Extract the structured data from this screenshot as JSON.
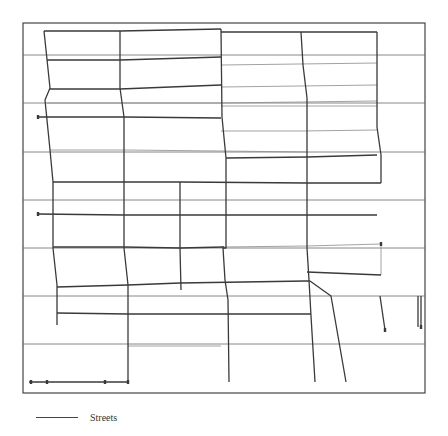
{
  "legend": {
    "items": [
      {
        "label": "Streets",
        "color": "#444444"
      }
    ]
  },
  "colors": {
    "street": "#3a3a3a",
    "grid": "#6a6a6a",
    "faint_street": "#8a8a8a",
    "frame": "#444444",
    "background": "#ffffff"
  },
  "map": {
    "frame": {
      "x": 23,
      "y": 23,
      "width": 402,
      "height": 370
    },
    "grid_y": [
      55,
      103,
      152,
      200,
      248,
      296,
      344
    ],
    "streets": [
      [
        [
          44,
          31
        ],
        [
          120,
          31
        ],
        [
          221,
          29
        ]
      ],
      [
        [
          221,
          32
        ],
        [
          300,
          32
        ],
        [
          377,
          32
        ]
      ],
      [
        [
          47,
          60
        ],
        [
          120,
          60
        ],
        [
          221,
          57
        ]
      ],
      [
        [
          50,
          89
        ],
        [
          120,
          89
        ],
        [
          221,
          85
        ]
      ],
      [
        [
          38,
          117
        ],
        [
          124,
          117
        ],
        [
          221,
          118
        ]
      ],
      [
        [
          226,
          158
        ],
        [
          307,
          157
        ],
        [
          377,
          155
        ]
      ],
      [
        [
          53,
          182
        ],
        [
          124,
          182
        ],
        [
          180,
          182
        ],
        [
          307,
          183
        ],
        [
          381,
          183
        ]
      ],
      [
        [
          38,
          214
        ],
        [
          124,
          215
        ],
        [
          226,
          215
        ],
        [
          307,
          215
        ],
        [
          377,
          215
        ]
      ],
      [
        [
          53,
          247
        ],
        [
          124,
          247
        ],
        [
          180,
          248
        ],
        [
          224,
          247
        ]
      ],
      [
        [
          307,
          272
        ],
        [
          381,
          275
        ]
      ],
      [
        [
          57,
          287
        ],
        [
          128,
          285
        ],
        [
          180,
          283
        ],
        [
          306,
          281
        ],
        [
          310,
          281
        ]
      ],
      [
        [
          57,
          313
        ],
        [
          128,
          314
        ],
        [
          221,
          314
        ],
        [
          311,
          314
        ]
      ],
      [
        [
          29,
          382
        ],
        [
          128,
          382
        ]
      ],
      [
        [
          44,
          31
        ],
        [
          50,
          88
        ],
        [
          45,
          100
        ],
        [
          50,
          150
        ],
        [
          53,
          182
        ],
        [
          53,
          248
        ],
        [
          57,
          285
        ],
        [
          57,
          325
        ]
      ],
      [
        [
          120,
          31
        ],
        [
          120,
          88
        ],
        [
          124,
          117
        ],
        [
          124,
          182
        ],
        [
          124,
          248
        ],
        [
          128,
          285
        ],
        [
          128,
          382
        ]
      ],
      [
        [
          221,
          29
        ],
        [
          222,
          117
        ],
        [
          226,
          158
        ],
        [
          226,
          248
        ],
        [
          223,
          248
        ],
        [
          225,
          280
        ],
        [
          228,
          300
        ],
        [
          229,
          382
        ]
      ],
      [
        [
          301,
          32
        ],
        [
          303,
          65
        ],
        [
          307,
          98
        ],
        [
          307,
          248
        ],
        [
          309,
          280
        ],
        [
          311,
          316
        ],
        [
          315,
          382
        ]
      ],
      [
        [
          377,
          32
        ],
        [
          377,
          127
        ],
        [
          381,
          155
        ],
        [
          381,
          183
        ]
      ],
      [
        [
          180,
          182
        ],
        [
          180,
          248
        ],
        [
          181,
          290
        ]
      ],
      [
        [
          310,
          281
        ],
        [
          331,
          296
        ],
        [
          346,
          382
        ]
      ],
      [
        [
          380,
          296
        ],
        [
          385,
          330
        ]
      ],
      [
        [
          421,
          296
        ],
        [
          421,
          327
        ]
      ],
      [
        [
          418,
          296
        ],
        [
          418,
          327
        ]
      ]
    ],
    "faint_streets": [
      [
        [
          47,
          103
        ],
        [
          120,
          103
        ],
        [
          221,
          103
        ],
        [
          377,
          101
        ]
      ],
      [
        [
          50,
          150
        ],
        [
          124,
          150
        ],
        [
          221,
          151
        ],
        [
          307,
          152
        ]
      ],
      [
        [
          221,
          247
        ],
        [
          307,
          246
        ],
        [
          381,
          244
        ]
      ],
      [
        [
          381,
          244
        ],
        [
          381,
          275
        ]
      ],
      [
        [
          128,
          346
        ],
        [
          221,
          346
        ]
      ],
      [
        [
          221,
          106
        ],
        [
          300,
          106
        ],
        [
          377,
          106
        ]
      ],
      [
        [
          221,
          131
        ],
        [
          300,
          131
        ],
        [
          377,
          130
        ]
      ],
      [
        [
          221,
          65
        ],
        [
          377,
          63
        ]
      ],
      [
        [
          221,
          87
        ],
        [
          377,
          85
        ]
      ]
    ],
    "endpoints": [
      [
        38,
        117
      ],
      [
        38,
        214
      ],
      [
        381,
        244
      ],
      [
        385,
        330
      ],
      [
        421,
        327
      ],
      [
        31,
        382
      ],
      [
        47,
        382
      ],
      [
        105,
        382
      ],
      [
        128,
        382
      ]
    ]
  }
}
